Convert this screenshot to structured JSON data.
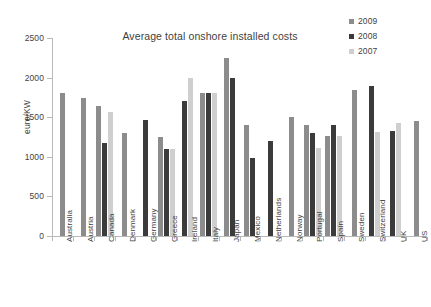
{
  "chart_data": {
    "type": "bar",
    "title": "Average total onshore installed costs",
    "xlabel": "",
    "ylabel": "euro/KW",
    "ylim": [
      0,
      2500
    ],
    "yticks": [
      0,
      500,
      1000,
      1500,
      2000,
      2500
    ],
    "grid": false,
    "legend_position": "top-right",
    "categories": [
      "Australia",
      "Austria",
      "Canada",
      "Denmark",
      "Germany",
      "Greece",
      "Ireland",
      "Italy",
      "Japan",
      "Mexico",
      "Netherlands",
      "Norway",
      "Portugal",
      "Spain",
      "Sweden",
      "Switzerland",
      "UK",
      "US"
    ],
    "series": [
      {
        "name": "2009",
        "color": "#8c8c8c",
        "values": [
          1800,
          1745,
          1645,
          1300,
          null,
          1250,
          null,
          1800,
          2245,
          1405,
          null,
          1505,
          1405,
          1260,
          1840,
          null,
          null,
          1455
        ]
      },
      {
        "name": "2008",
        "color": "#3b3b3b",
        "values": [
          null,
          null,
          1175,
          null,
          1460,
          1100,
          1700,
          1800,
          2000,
          985,
          1205,
          null,
          1305,
          1405,
          null,
          1890,
          1320,
          null
        ]
      },
      {
        "name": "2007",
        "color": "#cfcfcf",
        "values": [
          null,
          null,
          1565,
          null,
          null,
          1100,
          2000,
          1800,
          null,
          null,
          null,
          null,
          1105,
          1260,
          null,
          1310,
          1430,
          null
        ]
      }
    ]
  },
  "legend": {
    "items": [
      {
        "label": "2009",
        "color": "#8c8c8c"
      },
      {
        "label": "2008",
        "color": "#3b3b3b"
      },
      {
        "label": "2007",
        "color": "#cfcfcf"
      }
    ]
  }
}
